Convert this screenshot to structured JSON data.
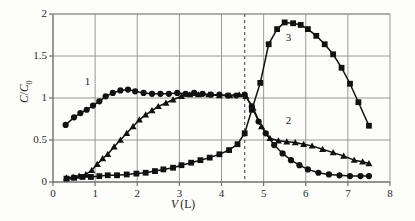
{
  "chart_data": {
    "type": "line",
    "title": "",
    "xlabel": "V (L)",
    "ylabel": "C/C0",
    "xlim": [
      0,
      8
    ],
    "ylim": [
      0,
      2
    ],
    "xticks": [
      0,
      1,
      2,
      3,
      4,
      5,
      6,
      7,
      8
    ],
    "yticks": [
      0,
      0.5,
      1,
      1.5,
      2
    ],
    "xtick_labels": [
      "0",
      "1",
      "2",
      "3",
      "4",
      "5",
      "6",
      "7",
      "8"
    ],
    "ytick_labels": [
      "0",
      "0.5",
      "1",
      "1.5",
      "2"
    ],
    "grid": true,
    "legend": "inline-annotations",
    "annotations": [
      {
        "text": "1",
        "x": 0.85,
        "y": 1.18
      },
      {
        "text": "2",
        "x": 5.62,
        "y": 0.72
      },
      {
        "text": "3",
        "x": 5.62,
        "y": 1.7
      }
    ],
    "reference_lines": [
      {
        "orientation": "vertical",
        "x": 4.55,
        "style": "dashed"
      }
    ],
    "series": [
      {
        "name": "1",
        "marker": "circle",
        "color": "#111111",
        "x": [
          0.3,
          0.5,
          0.65,
          0.8,
          0.95,
          1.1,
          1.25,
          1.42,
          1.6,
          1.78,
          1.95,
          2.15,
          2.35,
          2.55,
          2.75,
          2.95,
          3.15,
          3.35,
          3.55,
          3.75,
          3.95,
          4.15,
          4.35,
          4.55,
          4.72,
          4.88,
          5.05,
          5.25,
          5.45,
          5.65,
          5.85,
          6.05,
          6.3,
          6.55,
          6.8,
          7.05,
          7.3,
          7.5
        ],
        "y": [
          0.68,
          0.77,
          0.82,
          0.86,
          0.91,
          0.96,
          1.02,
          1.06,
          1.09,
          1.1,
          1.08,
          1.06,
          1.05,
          1.05,
          1.05,
          1.06,
          1.05,
          1.06,
          1.05,
          1.04,
          1.04,
          1.03,
          1.03,
          1.04,
          0.9,
          0.72,
          0.58,
          0.44,
          0.34,
          0.26,
          0.2,
          0.15,
          0.11,
          0.09,
          0.08,
          0.07,
          0.07,
          0.07
        ]
      },
      {
        "name": "2",
        "marker": "triangle",
        "color": "#111111",
        "x": [
          0.32,
          0.48,
          0.62,
          0.78,
          0.92,
          1.05,
          1.18,
          1.3,
          1.45,
          1.6,
          1.75,
          1.9,
          2.05,
          2.2,
          2.35,
          2.5,
          2.68,
          2.85,
          3.05,
          3.25,
          3.45,
          3.7,
          3.95,
          4.2,
          4.42,
          4.58,
          4.75,
          4.95,
          5.15,
          5.35,
          5.55,
          5.75,
          5.95,
          6.15,
          6.4,
          6.65,
          6.9,
          7.15,
          7.35,
          7.5
        ],
        "y": [
          0.05,
          0.06,
          0.07,
          0.09,
          0.14,
          0.21,
          0.28,
          0.33,
          0.42,
          0.5,
          0.58,
          0.66,
          0.74,
          0.8,
          0.85,
          0.9,
          0.94,
          0.98,
          1.02,
          1.04,
          1.04,
          1.04,
          1.03,
          1.03,
          1.04,
          1.02,
          0.88,
          0.66,
          0.52,
          0.49,
          0.48,
          0.47,
          0.45,
          0.43,
          0.39,
          0.35,
          0.31,
          0.26,
          0.24,
          0.22
        ]
      },
      {
        "name": "3",
        "marker": "square",
        "color": "#111111",
        "x": [
          0.32,
          0.5,
          0.7,
          0.9,
          1.1,
          1.3,
          1.52,
          1.75,
          1.98,
          2.2,
          2.42,
          2.62,
          2.85,
          3.05,
          3.28,
          3.5,
          3.72,
          3.95,
          4.18,
          4.38,
          4.55,
          4.72,
          4.92,
          5.12,
          5.32,
          5.5,
          5.7,
          5.88,
          6.05,
          6.25,
          6.45,
          6.65,
          6.85,
          7.05,
          7.25,
          7.5
        ],
        "y": [
          0.04,
          0.05,
          0.06,
          0.06,
          0.07,
          0.08,
          0.08,
          0.09,
          0.1,
          0.11,
          0.13,
          0.15,
          0.17,
          0.2,
          0.23,
          0.26,
          0.29,
          0.33,
          0.38,
          0.45,
          0.58,
          0.86,
          1.18,
          1.64,
          1.82,
          1.9,
          1.89,
          1.87,
          1.82,
          1.74,
          1.64,
          1.52,
          1.36,
          1.17,
          0.95,
          0.67
        ]
      }
    ]
  }
}
